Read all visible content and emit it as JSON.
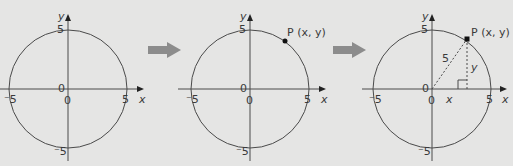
{
  "colors": {
    "background": "#e5e5e4",
    "ink": "#3a3a3a",
    "arrow": "#8c8c8c"
  },
  "panels": [
    {
      "id": "panel-1",
      "center": [
        68,
        89
      ],
      "radius": 59,
      "labels": {
        "y_axis": "y",
        "x_axis": "x",
        "top": "5",
        "bottom": "⁻5",
        "left": "⁻5",
        "right": "5",
        "origin_left": "0",
        "origin_below": "0"
      }
    },
    {
      "id": "panel-2",
      "center": [
        250,
        89
      ],
      "radius": 59,
      "labels": {
        "y_axis": "y",
        "x_axis": "x",
        "top": "5",
        "bottom": "⁻5",
        "left": "⁻5",
        "right": "5",
        "origin_left": "0",
        "origin_below": "0",
        "point": "P (x, y)"
      }
    },
    {
      "id": "panel-3",
      "center": [
        432,
        89
      ],
      "radius": 59,
      "labels": {
        "y_axis": "y",
        "x_axis": "x",
        "top": "5",
        "bottom": "⁻5",
        "left": "⁻5",
        "right": "5",
        "origin_left": "0",
        "origin_below": "0",
        "point": "P (x, y)",
        "hypotenuse": "5",
        "vertical_leg": "y",
        "horizontal_leg": "x"
      }
    }
  ],
  "arrows": [
    {
      "id": "arrow-1",
      "from": "panel-1",
      "to": "panel-2"
    },
    {
      "id": "arrow-2",
      "from": "panel-2",
      "to": "panel-3"
    }
  ]
}
